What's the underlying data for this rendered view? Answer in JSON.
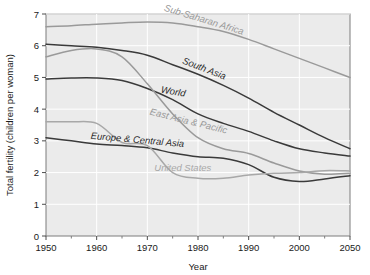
{
  "chart_data": {
    "type": "line",
    "title": "",
    "xlabel": "Year",
    "ylabel": "Total fertility (children per woman)",
    "xlim": [
      1950,
      2010
    ],
    "ylim": [
      0,
      7
    ],
    "xticks": [
      1950,
      1960,
      1970,
      1980,
      1990,
      2000,
      2050
    ],
    "yticks": [
      0,
      1,
      2,
      3,
      4,
      5,
      6,
      7
    ],
    "grid": true,
    "legend": "inline-labels",
    "plot_background": "#ebebeb",
    "x": [
      1950,
      1955,
      1960,
      1965,
      1970,
      1975,
      1980,
      1985,
      1990,
      1995,
      2000,
      2005,
      2010
    ],
    "series": [
      {
        "name": "Sub-Saharan Africa",
        "color": "#9a9a9a",
        "label_angle": 17,
        "values": [
          6.6,
          6.63,
          6.68,
          6.72,
          6.75,
          6.72,
          6.6,
          6.45,
          6.2,
          5.9,
          5.6,
          5.3,
          5.0
        ]
      },
      {
        "name": "South Asia",
        "color": "#3a3a3a",
        "label_angle": 21,
        "values": [
          6.05,
          6.0,
          5.95,
          5.85,
          5.7,
          5.4,
          5.1,
          4.75,
          4.35,
          3.9,
          3.5,
          3.1,
          2.75
        ]
      },
      {
        "name": "World",
        "color": "#3a3a3a",
        "label_angle": 10,
        "values": [
          4.95,
          4.98,
          4.98,
          4.9,
          4.65,
          4.3,
          3.85,
          3.55,
          3.3,
          3.0,
          2.75,
          2.62,
          2.52
        ]
      },
      {
        "name": "East Asia & Pacific",
        "color": "#9a9a9a",
        "label_angle": 14,
        "values": [
          5.65,
          5.85,
          5.9,
          5.65,
          4.8,
          3.85,
          3.1,
          2.75,
          2.6,
          2.3,
          2.05,
          1.95,
          1.98
        ]
      },
      {
        "name": "Europe & Central Asia",
        "color": "#3a3a3a",
        "label_angle": 5,
        "values": [
          3.1,
          3.0,
          2.9,
          2.85,
          2.78,
          2.62,
          2.5,
          2.45,
          2.25,
          1.85,
          1.72,
          1.8,
          1.9
        ]
      },
      {
        "name": "United States",
        "color": "#a8a8a8",
        "label_angle": 0,
        "values": [
          3.6,
          3.6,
          3.55,
          2.95,
          2.85,
          2.0,
          1.82,
          1.82,
          1.92,
          1.98,
          2.0,
          2.06,
          2.05
        ]
      }
    ]
  },
  "axes": {
    "y_title": "Total fertility (children per woman)",
    "x_title": "Year",
    "y_tick_labels": [
      "0",
      "1",
      "2",
      "3",
      "4",
      "5",
      "6",
      "7"
    ],
    "x_tick_labels": [
      "1950",
      "1960",
      "1970",
      "1980",
      "1990",
      "2000",
      "2050"
    ]
  },
  "series_labels": [
    {
      "text": "Sub-Saharan Africa"
    },
    {
      "text": "South Asia"
    },
    {
      "text": "World"
    },
    {
      "text": "East Asia & Pacific"
    },
    {
      "text": "Europe & Central Asia"
    },
    {
      "text": "United States"
    }
  ]
}
